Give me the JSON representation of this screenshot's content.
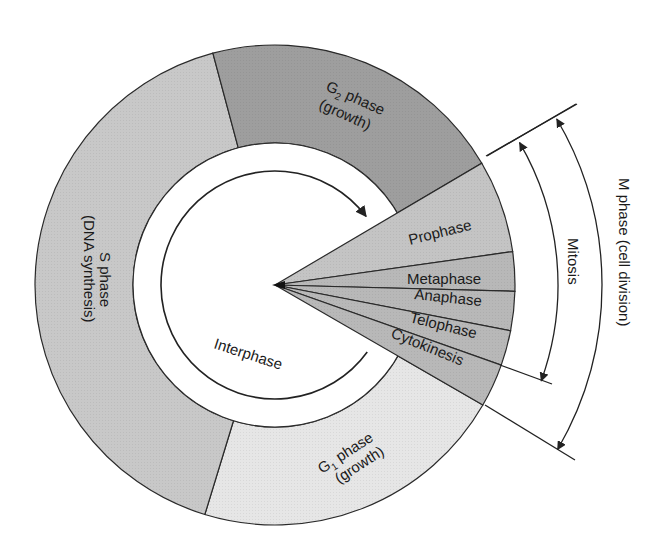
{
  "diagram": {
    "type": "cell-cycle",
    "center": [
      275,
      285
    ],
    "radii": {
      "outer": 240,
      "ring_inner": 142,
      "interphase_arc": 114
    },
    "colors": {
      "s_phase": "#c8c8c8",
      "g2_phase": "#9e9e9e",
      "g1_phase": "#e6e6e6",
      "prophase": "#c4c4c4",
      "mitosis_slices": "#b8b8b8",
      "stroke": "#2a2a2a",
      "text": "#1a1a1a",
      "background": "#ffffff"
    },
    "phases": {
      "g2": {
        "title": "G",
        "sub": "2",
        "title_rest": " phase",
        "note": "(growth)"
      },
      "s": {
        "title": "S phase",
        "note": "(DNA synthesis)"
      },
      "g1": {
        "title": "G",
        "sub": "1",
        "title_rest": " phase",
        "note": "(growth)"
      }
    },
    "mitotic_stages": [
      {
        "label": "Prophase"
      },
      {
        "label": "Metaphase"
      },
      {
        "label": "Anaphase"
      },
      {
        "label": "Telophase"
      },
      {
        "label": "Cytokinesis"
      }
    ],
    "interphase_label": "Interphase",
    "brackets": {
      "mitosis": "Mitosis",
      "m_phase": "M phase (cell division)"
    }
  }
}
